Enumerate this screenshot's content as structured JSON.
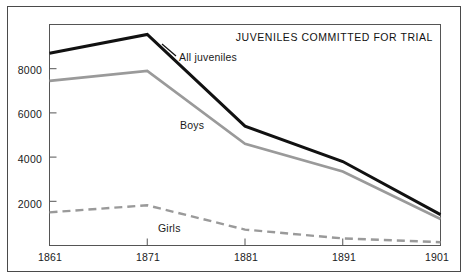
{
  "chart_data": {
    "type": "line",
    "title": "JUVENILES COMMITTED FOR TRIAL",
    "xlabel": "",
    "ylabel": "",
    "x": [
      1861,
      1871,
      1881,
      1891,
      1901
    ],
    "categories": [
      "1861",
      "1871",
      "1881",
      "1891",
      "1901"
    ],
    "xlim": [
      1861,
      1901
    ],
    "ylim": [
      0,
      10000
    ],
    "yticks": [
      2000,
      4000,
      6000,
      8000
    ],
    "ytick_labels": [
      "2000",
      "4000",
      "6000",
      "8000"
    ],
    "xtick_labels": [
      "1861",
      "1871",
      "1881",
      "1891",
      "1901"
    ],
    "grid": false,
    "legend_position": "inline-annotations",
    "series": [
      {
        "name": "All juveniles",
        "values": [
          8700,
          9550,
          5400,
          3800,
          1400
        ],
        "color": "#111111",
        "style": "solid",
        "width": 3
      },
      {
        "name": "Boys",
        "values": [
          7450,
          7900,
          4600,
          3350,
          1200
        ],
        "color": "#9a9a9a",
        "style": "solid",
        "width": 2.6
      },
      {
        "name": "Girls",
        "values": [
          1500,
          1820,
          720,
          320,
          150
        ],
        "color": "#9a9a9a",
        "style": "dashed",
        "width": 2.4
      }
    ],
    "annotations": [
      {
        "text": "All juveniles",
        "series": "All juveniles"
      },
      {
        "text": "Boys",
        "series": "Boys"
      },
      {
        "text": "Girls",
        "series": "Girls"
      }
    ]
  },
  "colors": {
    "frame": "#4a4a4a",
    "axis": "#555555",
    "background": "#ffffff",
    "all_juveniles": "#111111",
    "boys": "#9a9a9a",
    "girls": "#9a9a9a",
    "text": "#1a1a1a"
  }
}
